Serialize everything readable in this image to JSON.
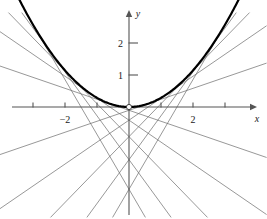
{
  "figure": {
    "background_color": "#ffffff",
    "curve_color": "#000000",
    "tangent_color": "#6b6b6b",
    "axis_color": "#555555",
    "label_color": "#1a1a1a"
  },
  "axes": {
    "x_axis_label": "x",
    "y_axis_label": "y",
    "x_ticks": [
      {
        "value": -3,
        "label": ""
      },
      {
        "value": -2,
        "label": "−2"
      },
      {
        "value": -1,
        "label": ""
      },
      {
        "value": 1,
        "label": ""
      },
      {
        "value": 2,
        "label": "2"
      },
      {
        "value": 3,
        "label": ""
      }
    ],
    "y_ticks": [
      {
        "value": 1,
        "label": "1"
      },
      {
        "value": 2,
        "label": "2"
      }
    ],
    "origin_marker": "open-circle"
  },
  "chart_data": {
    "type": "line",
    "title": "",
    "xlabel": "x",
    "ylabel": "y",
    "xlim": [
      -4.05,
      4.3
    ],
    "ylim": [
      -3.45,
      2.95
    ],
    "grid": false,
    "legend": "none",
    "series": [
      {
        "name": "parabola",
        "kind": "curve",
        "equation": "y = x^2 / 3.5",
        "coefficient": 0.2857,
        "x_range": [
          -3.55,
          3.55
        ],
        "stroke_width": 2.2,
        "color": "#000000",
        "x": [
          -3.55,
          -3.2,
          -2.8,
          -2.4,
          -2.0,
          -1.6,
          -1.2,
          -0.8,
          -0.4,
          0,
          0.4,
          0.8,
          1.2,
          1.6,
          2.0,
          2.4,
          2.8,
          3.2,
          3.55
        ],
        "y": [
          3.6,
          2.926,
          2.24,
          1.646,
          1.143,
          0.731,
          0.411,
          0.183,
          0.046,
          0,
          0.046,
          0.183,
          0.411,
          0.731,
          1.143,
          1.646,
          2.24,
          2.926,
          3.6
        ]
      },
      {
        "name": "tangent-lines",
        "kind": "tangent-family",
        "description": "Tangent lines to y = x^2/3.5 drawn at evenly spaced points of tangency",
        "color": "#6b6b6b",
        "stroke_width": 0.7,
        "tangent_points": [
          -3.0,
          -2.4,
          -1.8,
          -1.2,
          -0.6,
          0.6,
          1.2,
          1.8,
          2.4,
          3.0
        ],
        "lines": [
          {
            "point_of_tangency": -3.0,
            "slope": -1.714,
            "y_intercept": -2.571
          },
          {
            "point_of_tangency": -2.4,
            "slope": -1.371,
            "y_intercept": -1.646
          },
          {
            "point_of_tangency": -1.8,
            "slope": -1.029,
            "y_intercept": -0.926
          },
          {
            "point_of_tangency": -1.2,
            "slope": -0.686,
            "y_intercept": -0.411
          },
          {
            "point_of_tangency": -0.6,
            "slope": -0.343,
            "y_intercept": -0.103
          },
          {
            "point_of_tangency": 0.6,
            "slope": 0.343,
            "y_intercept": -0.103
          },
          {
            "point_of_tangency": 1.2,
            "slope": 0.686,
            "y_intercept": -0.411
          },
          {
            "point_of_tangency": 1.8,
            "slope": 1.029,
            "y_intercept": -0.926
          },
          {
            "point_of_tangency": 2.4,
            "slope": 1.371,
            "y_intercept": -1.646
          },
          {
            "point_of_tangency": 3.0,
            "slope": 1.714,
            "y_intercept": -2.571
          }
        ]
      }
    ]
  }
}
